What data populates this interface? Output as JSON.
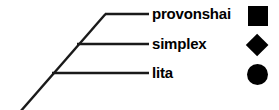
{
  "diagram": {
    "kind": "cladogram",
    "line_color": "#1a1a1a",
    "text_color": "#000000",
    "background": "#ffffff",
    "branch_line_width": 2.4,
    "stem_line_width": 2.4,
    "stem": {
      "name": "main-stem",
      "x1": 20,
      "y1": 112,
      "x2": 105.5,
      "y2": 14
    },
    "taxa": [
      {
        "label": "provonshai",
        "branch_name": "branch-provonshai",
        "branch": {
          "x1": 105,
          "y1": 14,
          "x2": 149,
          "y2": 14
        },
        "label_x": 152,
        "label_y": 6,
        "symbol": "square",
        "symbol_x": 248,
        "symbol_y": 6,
        "symbol_size": 20
      },
      {
        "label": "simplex",
        "branch_name": "branch-simplex",
        "branch": {
          "x1": 77,
          "y1": 44,
          "x2": 149,
          "y2": 44
        },
        "label_x": 152,
        "label_y": 36,
        "symbol": "diamond",
        "symbol_x": 246,
        "symbol_y": 34,
        "symbol_size": 23
      },
      {
        "label": "lita",
        "branch_name": "branch-lita",
        "branch": {
          "x1": 52,
          "y1": 73,
          "x2": 149,
          "y2": 73
        },
        "label_x": 152,
        "label_y": 65,
        "symbol": "circle",
        "symbol_x": 247,
        "symbol_y": 64,
        "symbol_size": 21
      }
    ]
  }
}
